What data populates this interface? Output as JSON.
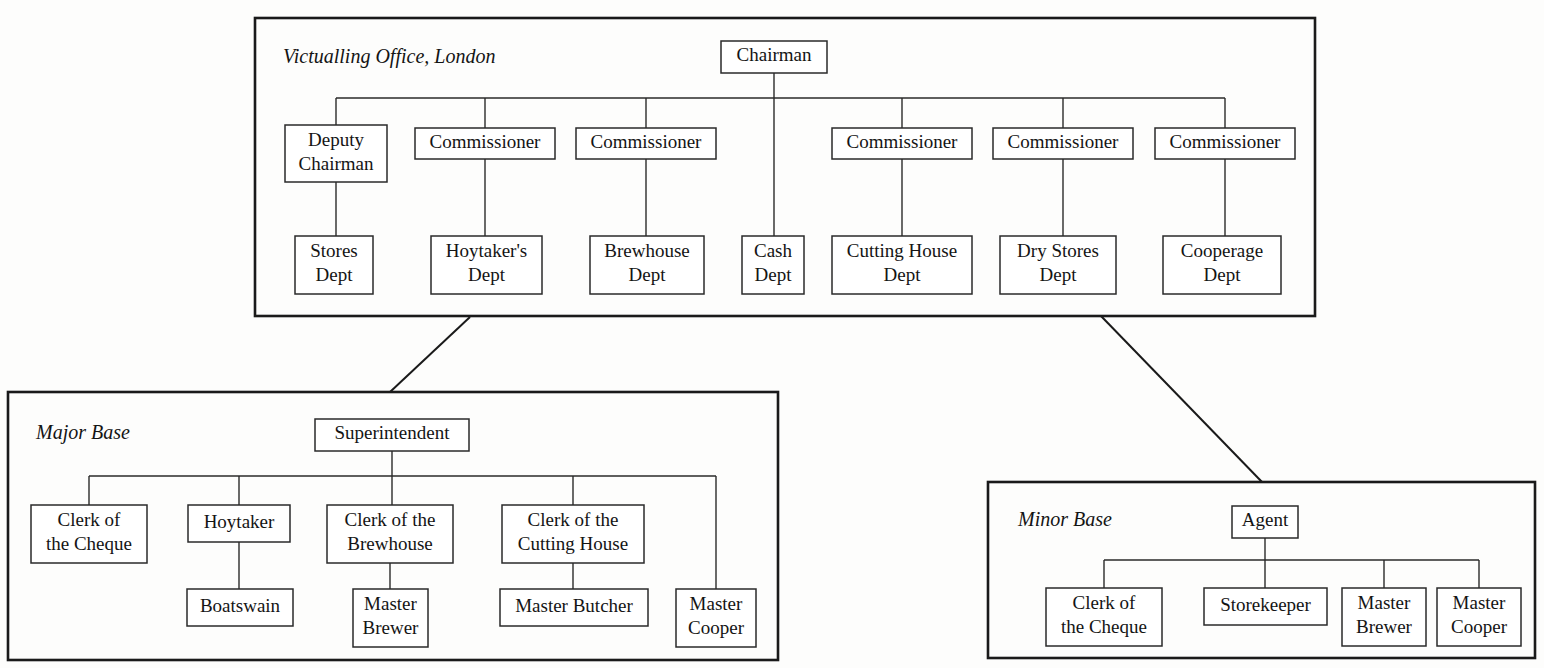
{
  "figure": {
    "type": "organization-chart"
  },
  "panels": [
    {
      "id": "victualling-office",
      "title": "Victualling Office, London",
      "box": {
        "x": 255,
        "y": 18,
        "w": 1060,
        "h": 298
      },
      "title_pos": {
        "x": 283,
        "y": 58
      },
      "nodes": [
        {
          "id": "chairman",
          "label": "Chairman",
          "lines": [
            "Chairman"
          ],
          "x": 721,
          "y": 41,
          "w": 106,
          "h": 32
        },
        {
          "id": "deputy-chairman",
          "label": "Deputy Chairman",
          "lines": [
            "Deputy",
            "Chairman"
          ],
          "x": 285,
          "y": 125,
          "w": 102,
          "h": 57
        },
        {
          "id": "commissioner-1",
          "label": "Commissioner",
          "lines": [
            "Commissioner"
          ],
          "x": 415,
          "y": 128,
          "w": 140,
          "h": 31
        },
        {
          "id": "commissioner-2",
          "label": "Commissioner",
          "lines": [
            "Commissioner"
          ],
          "x": 576,
          "y": 128,
          "w": 140,
          "h": 31
        },
        {
          "id": "commissioner-3",
          "label": "Commissioner",
          "lines": [
            "Commissioner"
          ],
          "x": 832,
          "y": 128,
          "w": 140,
          "h": 31
        },
        {
          "id": "commissioner-4",
          "label": "Commissioner",
          "lines": [
            "Commissioner"
          ],
          "x": 993,
          "y": 128,
          "w": 140,
          "h": 31
        },
        {
          "id": "commissioner-5",
          "label": "Commissioner",
          "lines": [
            "Commissioner"
          ],
          "x": 1155,
          "y": 128,
          "w": 140,
          "h": 31
        },
        {
          "id": "stores-dept",
          "label": "Stores Dept",
          "lines": [
            "Stores",
            "Dept"
          ],
          "x": 295,
          "y": 236,
          "w": 78,
          "h": 58
        },
        {
          "id": "hoytakers-dept",
          "label": "Hoytaker's Dept",
          "lines": [
            "Hoytaker's",
            "Dept"
          ],
          "x": 431,
          "y": 236,
          "w": 111,
          "h": 58
        },
        {
          "id": "brewhouse-dept",
          "label": "Brewhouse Dept",
          "lines": [
            "Brewhouse",
            "Dept"
          ],
          "x": 590,
          "y": 236,
          "w": 114,
          "h": 58
        },
        {
          "id": "cash-dept",
          "label": "Cash Dept",
          "lines": [
            "Cash",
            "Dept"
          ],
          "x": 742,
          "y": 236,
          "w": 62,
          "h": 58
        },
        {
          "id": "cutting-house-dept",
          "label": "Cutting House Dept",
          "lines": [
            "Cutting House",
            "Dept"
          ],
          "x": 832,
          "y": 236,
          "w": 140,
          "h": 58
        },
        {
          "id": "dry-stores-dept",
          "label": "Dry Stores Dept",
          "lines": [
            "Dry Stores",
            "Dept"
          ],
          "x": 1000,
          "y": 236,
          "w": 116,
          "h": 58
        },
        {
          "id": "cooperage-dept",
          "label": "Cooperage Dept",
          "lines": [
            "Cooperage",
            "Dept"
          ],
          "x": 1163,
          "y": 236,
          "w": 118,
          "h": 58
        }
      ],
      "bus": {
        "y": 98,
        "x1": 336,
        "x2": 1225
      },
      "links": [
        {
          "from": "chairman",
          "kind": "stem-down",
          "x": 774,
          "y1": 73,
          "y2": 236
        },
        {
          "from": "bus",
          "kind": "drop",
          "x": 336,
          "y1": 98,
          "y2": 125
        },
        {
          "from": "bus",
          "kind": "drop",
          "x": 485,
          "y1": 98,
          "y2": 128
        },
        {
          "from": "bus",
          "kind": "drop",
          "x": 646,
          "y1": 98,
          "y2": 128
        },
        {
          "from": "bus",
          "kind": "drop",
          "x": 902,
          "y1": 98,
          "y2": 128
        },
        {
          "from": "bus",
          "kind": "drop",
          "x": 1063,
          "y1": 98,
          "y2": 128
        },
        {
          "from": "bus",
          "kind": "drop",
          "x": 1225,
          "y1": 98,
          "y2": 128
        },
        {
          "from": "deputy-chairman",
          "kind": "drop",
          "x": 336,
          "y1": 182,
          "y2": 236
        },
        {
          "from": "commissioner-1",
          "kind": "drop",
          "x": 485,
          "y1": 159,
          "y2": 236
        },
        {
          "from": "commissioner-2",
          "kind": "drop",
          "x": 646,
          "y1": 159,
          "y2": 236
        },
        {
          "from": "commissioner-3",
          "kind": "drop",
          "x": 902,
          "y1": 159,
          "y2": 236
        },
        {
          "from": "commissioner-4",
          "kind": "drop",
          "x": 1063,
          "y1": 159,
          "y2": 236
        },
        {
          "from": "commissioner-5",
          "kind": "drop",
          "x": 1225,
          "y1": 159,
          "y2": 236
        }
      ]
    },
    {
      "id": "major-base",
      "title": "Major Base",
      "box": {
        "x": 8,
        "y": 392,
        "w": 770,
        "h": 268
      },
      "title_pos": {
        "x": 36,
        "y": 434
      },
      "nodes": [
        {
          "id": "superintendent",
          "label": "Superintendent",
          "lines": [
            "Superintendent"
          ],
          "x": 315,
          "y": 419,
          "w": 154,
          "h": 32
        },
        {
          "id": "clerk-of-the-cheque-major",
          "label": "Clerk of the Cheque",
          "lines": [
            "Clerk of",
            "the Cheque"
          ],
          "x": 31,
          "y": 505,
          "w": 116,
          "h": 58
        },
        {
          "id": "hoytaker",
          "label": "Hoytaker",
          "lines": [
            "Hoytaker"
          ],
          "x": 188,
          "y": 505,
          "w": 102,
          "h": 37
        },
        {
          "id": "clerk-of-the-brewhouse",
          "label": "Clerk of the Brewhouse",
          "lines": [
            "Clerk of the",
            "Brewhouse"
          ],
          "x": 327,
          "y": 505,
          "w": 126,
          "h": 58
        },
        {
          "id": "clerk-of-the-cutting-house",
          "label": "Clerk of the Cutting House",
          "lines": [
            "Clerk of the",
            "Cutting House"
          ],
          "x": 502,
          "y": 505,
          "w": 142,
          "h": 58
        },
        {
          "id": "boatswain",
          "label": "Boatswain",
          "lines": [
            "Boatswain"
          ],
          "x": 187,
          "y": 589,
          "w": 106,
          "h": 37
        },
        {
          "id": "master-brewer-major",
          "label": "Master Brewer",
          "lines": [
            "Master",
            "Brewer"
          ],
          "x": 353,
          "y": 589,
          "w": 75,
          "h": 58
        },
        {
          "id": "master-butcher",
          "label": "Master Butcher",
          "lines": [
            "Master Butcher"
          ],
          "x": 500,
          "y": 589,
          "w": 148,
          "h": 37
        },
        {
          "id": "master-cooper-major",
          "label": "Master Cooper",
          "lines": [
            "Master",
            "Cooper"
          ],
          "x": 676,
          "y": 589,
          "w": 80,
          "h": 58
        }
      ],
      "bus": {
        "y": 476,
        "x1": 89,
        "x2": 716
      },
      "links": [
        {
          "from": "superintendent",
          "kind": "stem-down",
          "x": 392,
          "y1": 451,
          "y2": 505
        },
        {
          "from": "bus",
          "kind": "drop",
          "x": 89,
          "y1": 476,
          "y2": 505
        },
        {
          "from": "bus",
          "kind": "drop",
          "x": 239,
          "y1": 476,
          "y2": 505
        },
        {
          "from": "bus",
          "kind": "drop",
          "x": 573,
          "y1": 476,
          "y2": 505
        },
        {
          "from": "bus",
          "kind": "drop",
          "x": 716,
          "y1": 476,
          "y2": 589
        },
        {
          "from": "hoytaker",
          "kind": "drop",
          "x": 239,
          "y1": 542,
          "y2": 589
        },
        {
          "from": "clerk-of-the-brewhouse",
          "kind": "drop",
          "x": 390,
          "y1": 563,
          "y2": 589
        },
        {
          "from": "clerk-of-the-cutting-house",
          "kind": "drop",
          "x": 573,
          "y1": 563,
          "y2": 589
        }
      ]
    },
    {
      "id": "minor-base",
      "title": "Minor Base",
      "box": {
        "x": 988,
        "y": 482,
        "w": 547,
        "h": 176
      },
      "title_pos": {
        "x": 1018,
        "y": 521
      },
      "nodes": [
        {
          "id": "agent",
          "label": "Agent",
          "lines": [
            "Agent"
          ],
          "x": 1232,
          "y": 506,
          "w": 66,
          "h": 32
        },
        {
          "id": "clerk-of-the-cheque-minor",
          "label": "Clerk of the Cheque",
          "lines": [
            "Clerk of",
            "the Cheque"
          ],
          "x": 1046,
          "y": 588,
          "w": 116,
          "h": 58
        },
        {
          "id": "storekeeper",
          "label": "Storekeeper",
          "lines": [
            "Storekeeper"
          ],
          "x": 1204,
          "y": 588,
          "w": 123,
          "h": 37
        },
        {
          "id": "master-brewer-minor",
          "label": "Master Brewer",
          "lines": [
            "Master",
            "Brewer"
          ],
          "x": 1342,
          "y": 588,
          "w": 84,
          "h": 58
        },
        {
          "id": "master-cooper-minor",
          "label": "Master Cooper",
          "lines": [
            "Master",
            "Cooper"
          ],
          "x": 1437,
          "y": 588,
          "w": 84,
          "h": 58
        }
      ],
      "bus": {
        "y": 560,
        "x1": 1104,
        "x2": 1479
      },
      "links": [
        {
          "from": "agent",
          "kind": "stem-down",
          "x": 1265,
          "y1": 538,
          "y2": 588
        },
        {
          "from": "bus",
          "kind": "drop",
          "x": 1104,
          "y1": 560,
          "y2": 588
        },
        {
          "from": "bus",
          "kind": "drop",
          "x": 1384,
          "y1": 560,
          "y2": 588
        },
        {
          "from": "bus",
          "kind": "drop",
          "x": 1479,
          "y1": 560,
          "y2": 588
        }
      ]
    }
  ],
  "inter_panel_links": [
    {
      "id": "office-to-major-base",
      "from": "victualling-office",
      "to": "major-base",
      "x1": 470,
      "y1": 317,
      "x2": 390,
      "y2": 392
    },
    {
      "id": "office-to-minor-base",
      "from": "victualling-office",
      "to": "minor-base",
      "x1": 1101,
      "y1": 316,
      "x2": 1262,
      "y2": 482
    }
  ],
  "colors": {
    "background": "#fdfdfc",
    "panel_stroke": "#1a1a1a",
    "node_stroke": "#2a2a2a",
    "text": "#141414"
  }
}
